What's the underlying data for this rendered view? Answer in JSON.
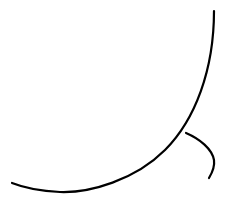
{
  "canvas": {
    "width": 229,
    "height": 200,
    "background": "#ffffff"
  },
  "stroke": {
    "color": "#000000",
    "width": 2.2
  },
  "shapes": {
    "large_arc": {
      "path": "M 214 11 C 214 70, 195 120, 165 150 C 135 180, 90 193, 60 192 C 40 191, 22 187, 12 183"
    },
    "small_arc": {
      "path": "M 186 133 C 200 139, 212 149, 214 160 C 215 167, 212 173, 209 178"
    }
  }
}
